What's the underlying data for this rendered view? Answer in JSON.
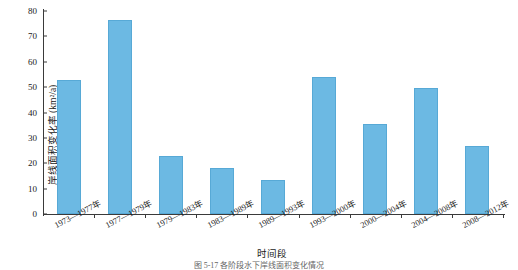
{
  "chart_data": {
    "type": "bar",
    "title": "",
    "xlabel": "时间段",
    "ylabel": "岸线面积变化率 (km²/a)",
    "categories": [
      "1973—1977年",
      "1977—1979年",
      "1979—1983年",
      "1983—1989年",
      "1989—1993年",
      "1993—2000年",
      "2000—2004年",
      "2004—2008年",
      "2008—2012年"
    ],
    "values": [
      53,
      76.5,
      23,
      18,
      13.5,
      54,
      35.5,
      49.5,
      27
    ],
    "ylim": [
      0,
      80
    ],
    "yticks": [
      0,
      10,
      20,
      30,
      40,
      50,
      60,
      70,
      80
    ],
    "ytick_labels": [
      "0",
      "10",
      "20",
      "30",
      "40",
      "50",
      "60",
      "70",
      "80"
    ],
    "grid": false,
    "legend": null,
    "bar_color": "#6cb9e3",
    "bar_border_color": "#57a9d6",
    "axis_color": "#3a3a3a"
  },
  "caption": "图 5-17   各阶段水下岸线面积变化情况"
}
